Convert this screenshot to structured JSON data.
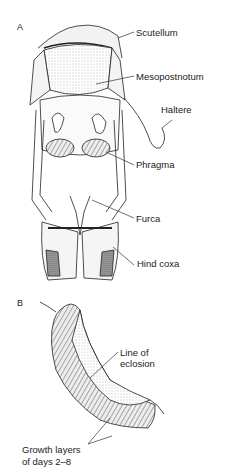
{
  "figure": {
    "panel_a": {
      "letter": "A",
      "labels": {
        "scutellum": "Scutellum",
        "mesopostnotum": "Mesopostnotum",
        "haltere": "Haltere",
        "phragma": "Phragma",
        "furca": "Furca",
        "hind_coxa": "Hind coxa"
      }
    },
    "panel_b": {
      "letter": "B",
      "labels": {
        "line_of_eclosion_1": "Line of",
        "line_of_eclosion_2": "eclosion",
        "growth_layers_1": "Growth layers",
        "growth_layers_2": "of days 2–8"
      }
    }
  }
}
